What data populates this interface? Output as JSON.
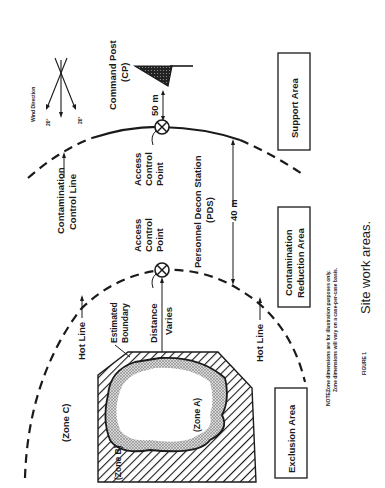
{
  "figure": {
    "title": "Site work areas.",
    "figure_label": "FIGURE 1",
    "orientation": "rotated 90° counter-clockwise",
    "note_label": "NOTE:",
    "note_lines": [
      "Zone dimensions are for illustration purposes only.",
      "Zone dimensions will vary on a case-per-case basis."
    ]
  },
  "zones": {
    "zone_a": "(Zone A)",
    "zone_b": "(Zone B)",
    "zone_c": "(Zone C)"
  },
  "areas": {
    "support": "Support Area",
    "contamination_reduction_line1": "Contamination",
    "contamination_reduction_line2": "Reduction Area",
    "exclusion": "Exclusion Area"
  },
  "lines": {
    "contamination_control_line1": "Contamination",
    "contamination_control_line2": "Control Line",
    "hot_line_upper": "Hot Line",
    "hot_line_lower": "Hot Line",
    "estimated_boundary_line1": "Estimated",
    "estimated_boundary_line2": "Boundary"
  },
  "points": {
    "access_control_outer_line1": "Access",
    "access_control_outer_line2": "Control",
    "access_control_outer_line3": "Point",
    "access_control_inner_line1": "Access",
    "access_control_inner_line2": "Control",
    "access_control_inner_line3": "Point",
    "pds_line1": "Personnel Decon Station",
    "pds_line2": "(PDS)",
    "command_post_line1": "Command Post",
    "command_post_line2": "(CP)"
  },
  "dimensions": {
    "cp_distance": "50 m",
    "pds_width": "40 m",
    "distance_line1": "Distance",
    "distance_line2": "Varies"
  },
  "wind": {
    "label": "Wind Direction",
    "angle_left": "20°",
    "angle_right": "20°"
  }
}
